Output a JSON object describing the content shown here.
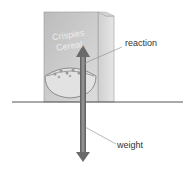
{
  "diagram": {
    "box_text_line1": "Crispies",
    "box_text_line2": "Cereal",
    "labels": {
      "reaction": "reaction",
      "weight": "weight"
    },
    "colors": {
      "box_front": "#c8c8c8",
      "box_side": "#d8d8d8",
      "table_line": "#555555",
      "arrow": "#777777",
      "leader_line": "#888888"
    }
  }
}
